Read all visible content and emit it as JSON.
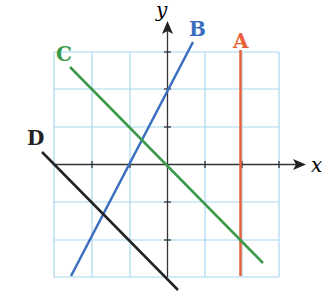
{
  "axes": {
    "x_label": "x",
    "y_label": "y"
  },
  "grid": {
    "x_range": [
      -3,
      3
    ],
    "y_range": [
      -3,
      3
    ],
    "color": "#a8d8f0"
  },
  "lines": [
    {
      "label": "A",
      "color": "#e8603a",
      "equation": "x = 2"
    },
    {
      "label": "B",
      "color": "#3a6fc0",
      "equation": "y = 2x + 2"
    },
    {
      "label": "C",
      "color": "#3a9a4a",
      "equation": "y = -x"
    },
    {
      "label": "D",
      "color": "#222222",
      "equation": "y = -x - 3"
    }
  ]
}
